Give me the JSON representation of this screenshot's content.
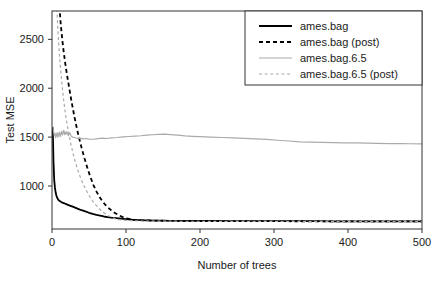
{
  "chart_data": {
    "type": "line",
    "title": "",
    "xlabel": "Number of trees",
    "ylabel": "Test MSE",
    "xlim": [
      0,
      500
    ],
    "ylim": [
      560,
      2790
    ],
    "xticks": [
      0,
      100,
      200,
      300,
      400,
      500
    ],
    "yticks": [
      1000,
      1500,
      2000,
      2500
    ],
    "xtick_labels": [
      "0",
      "100",
      "200",
      "300",
      "400",
      "500"
    ],
    "ytick_labels": [
      "1000",
      "1500",
      "2000",
      "2500"
    ],
    "grid": false,
    "legend_position": "top-right",
    "series": [
      {
        "name": "ames.bag",
        "color": "#000000",
        "dash": "solid",
        "width": 1.8,
        "x": [
          1,
          2,
          3,
          4,
          5,
          6,
          7,
          8,
          9,
          10,
          12,
          14,
          16,
          18,
          20,
          24,
          28,
          32,
          36,
          40,
          45,
          50,
          55,
          60,
          65,
          70,
          75,
          80,
          90,
          100,
          110,
          120,
          130,
          140,
          150,
          160,
          170,
          180,
          190,
          200,
          220,
          240,
          260,
          280,
          300,
          320,
          340,
          360,
          380,
          400,
          420,
          440,
          460,
          480,
          500
        ],
        "values": [
          1600,
          1250,
          1060,
          980,
          930,
          900,
          880,
          865,
          855,
          848,
          838,
          830,
          824,
          818,
          812,
          800,
          788,
          776,
          764,
          752,
          740,
          726,
          714,
          704,
          696,
          688,
          682,
          676,
          668,
          660,
          654,
          650,
          648,
          646,
          645,
          644,
          644,
          643,
          643,
          642,
          642,
          641,
          641,
          641,
          640,
          640,
          640,
          640,
          639,
          639,
          639,
          639,
          638,
          638,
          638
        ]
      },
      {
        "name": "ames.bag (post)",
        "color": "#000000",
        "dash": "dashed",
        "width": 1.8,
        "x": [
          1,
          2,
          3,
          4,
          5,
          6,
          7,
          8,
          9,
          10,
          12,
          14,
          16,
          18,
          20,
          22,
          24,
          26,
          28,
          30,
          33,
          36,
          40,
          44,
          48,
          52,
          56,
          60,
          64,
          68,
          72,
          76,
          80,
          85,
          90,
          95,
          100,
          110,
          120,
          140,
          160,
          200,
          250,
          300,
          350,
          400,
          450,
          500
        ],
        "values": [
          5200,
          4600,
          4150,
          3850,
          3600,
          3400,
          3220,
          3060,
          2940,
          2830,
          2640,
          2490,
          2360,
          2250,
          2150,
          2060,
          1970,
          1880,
          1800,
          1720,
          1610,
          1510,
          1390,
          1280,
          1180,
          1090,
          1010,
          945,
          890,
          845,
          808,
          778,
          752,
          724,
          702,
          684,
          670,
          655,
          650,
          645,
          643,
          641,
          640,
          640,
          639,
          639,
          638,
          638
        ]
      },
      {
        "name": "ames.bag.6.5",
        "color": "#aaaaaa",
        "dash": "solid",
        "width": 1.2,
        "x": [
          1,
          2,
          3,
          4,
          5,
          6,
          7,
          8,
          9,
          10,
          11,
          12,
          13,
          14,
          15,
          16,
          17,
          18,
          19,
          20,
          22,
          24,
          26,
          28,
          30,
          34,
          38,
          42,
          46,
          50,
          56,
          62,
          68,
          74,
          80,
          88,
          96,
          104,
          112,
          120,
          128,
          136,
          144,
          152,
          160,
          170,
          180,
          190,
          200,
          215,
          230,
          245,
          260,
          275,
          290,
          305,
          320,
          335,
          350,
          365,
          380,
          395,
          410,
          425,
          440,
          455,
          470,
          485,
          500
        ],
        "values": [
          1610,
          1560,
          1520,
          1540,
          1495,
          1520,
          1545,
          1500,
          1530,
          1550,
          1505,
          1535,
          1560,
          1520,
          1545,
          1570,
          1525,
          1550,
          1530,
          1555,
          1515,
          1545,
          1508,
          1500,
          1496,
          1488,
          1490,
          1482,
          1486,
          1480,
          1478,
          1484,
          1490,
          1486,
          1492,
          1496,
          1502,
          1506,
          1510,
          1514,
          1520,
          1524,
          1528,
          1530,
          1526,
          1520,
          1512,
          1508,
          1504,
          1500,
          1496,
          1492,
          1488,
          1482,
          1476,
          1468,
          1460,
          1452,
          1448,
          1446,
          1444,
          1442,
          1440,
          1438,
          1436,
          1434,
          1433,
          1432,
          1431
        ]
      },
      {
        "name": "ames.bag.6.5 (post)",
        "color": "#aaaaaa",
        "dash": "dashed",
        "width": 1.2,
        "x": [
          1,
          2,
          3,
          4,
          5,
          6,
          7,
          8,
          9,
          10,
          11,
          12,
          13,
          14,
          15,
          16,
          17,
          18,
          19,
          20,
          22,
          24,
          26,
          28,
          30,
          32,
          34,
          36,
          38,
          40,
          43,
          46,
          49,
          52,
          55,
          58,
          62,
          66,
          70,
          75,
          80,
          85,
          90,
          100,
          120,
          150,
          200,
          300,
          400,
          500
        ],
        "values": [
          4700,
          4100,
          3680,
          3360,
          3110,
          2910,
          2740,
          2590,
          2460,
          2350,
          2250,
          2160,
          2080,
          2000,
          1930,
          1866,
          1806,
          1750,
          1698,
          1650,
          1562,
          1484,
          1412,
          1348,
          1288,
          1234,
          1184,
          1138,
          1096,
          1058,
          1006,
          960,
          918,
          880,
          846,
          816,
          782,
          752,
          726,
          700,
          680,
          666,
          656,
          648,
          642,
          640,
          639,
          638,
          638,
          638
        ]
      }
    ],
    "legend_entries": [
      "ames.bag",
      "ames.bag (post)",
      "ames.bag.6.5",
      "ames.bag.6.5 (post)"
    ]
  },
  "axes": {
    "y_label": "Test MSE",
    "x_label": "Number of trees"
  },
  "colors": {
    "series_dark": "#000000",
    "series_light": "#aaaaaa",
    "axis": "#333333",
    "background": "#ffffff"
  }
}
